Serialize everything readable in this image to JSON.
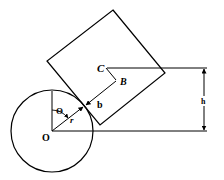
{
  "diagram": {
    "title": "",
    "labels": {
      "center_cube": "C",
      "contact_offset_point": "B",
      "half_side": "b",
      "height": "h",
      "angle": "Θ",
      "radius": "r",
      "origin": "O"
    },
    "colors": {
      "stroke": "#000000",
      "background": "#ffffff"
    }
  }
}
